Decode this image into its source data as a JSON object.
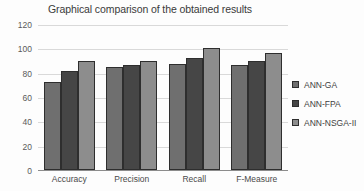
{
  "chart_data": {
    "type": "bar",
    "title": "Graphical comparison of the obtained results",
    "xlabel": "",
    "ylabel": "",
    "ylim": [
      0,
      120
    ],
    "yticks": [
      0,
      20,
      40,
      60,
      80,
      100,
      120
    ],
    "grid": true,
    "legend_position": "right",
    "categories": [
      "Accuracy",
      "Precision",
      "Recall",
      "F-Measure"
    ],
    "series": [
      {
        "name": "ANN-GA",
        "color": "#6f6f6f",
        "values": [
          72,
          84.5,
          87,
          86
        ]
      },
      {
        "name": "ANN-FPA",
        "color": "#464646",
        "values": [
          81,
          86.5,
          92,
          90
        ]
      },
      {
        "name": "ANN-NSGA-II",
        "color": "#8d8d8d",
        "values": [
          90,
          89.5,
          100,
          96
        ]
      }
    ]
  }
}
